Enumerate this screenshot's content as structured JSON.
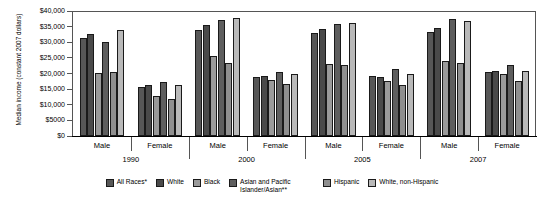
{
  "chart_data": {
    "type": "bar",
    "title": "",
    "xlabel": "",
    "ylabel": "Median income (constant 2007 dollars)",
    "ylim": [
      0,
      40000
    ],
    "ytick_labels": [
      "$40,000",
      "$35,000",
      "$30,000",
      "$25,000",
      "$20,000",
      "$15,000",
      "$10,000",
      "$5000",
      "$0"
    ],
    "ytick_values": [
      40000,
      35000,
      30000,
      25000,
      20000,
      15000,
      10000,
      5000,
      0
    ],
    "grid": false,
    "legend_position": "bottom",
    "categories": [
      "1990 Male",
      "1990 Female",
      "2000 Male",
      "2000 Female",
      "2005 Male",
      "2005 Female",
      "2007 Male",
      "2007 Female"
    ],
    "group_labels": [
      "Male",
      "Female",
      "Male",
      "Female",
      "Male",
      "Female",
      "Male",
      "Female"
    ],
    "year_labels": [
      "1990",
      "2000",
      "2005",
      "2007"
    ],
    "series": [
      {
        "name": "All Races*",
        "color": "#575757",
        "values": [
          31400,
          15700,
          33900,
          19000,
          33000,
          19100,
          33200,
          20500
        ]
      },
      {
        "name": "White",
        "color": "#4a4a4a",
        "values": [
          32600,
          16200,
          35400,
          19100,
          34200,
          19000,
          34700,
          20800
        ]
      },
      {
        "name": "Black",
        "color": "#9a9a9a",
        "values": [
          20300,
          12900,
          25600,
          18000,
          23000,
          17700,
          24000,
          19900
        ]
      },
      {
        "name": "Asian and Pacific Islander/Asian**",
        "color": "#5e5e5e",
        "values": [
          30100,
          17300,
          37000,
          20400,
          36000,
          21400,
          37300,
          22800
        ]
      },
      {
        "name": "Hispanic",
        "color": "#8f8f8f",
        "values": [
          20600,
          11800,
          23400,
          16600,
          22700,
          16200,
          23300,
          17700
        ]
      },
      {
        "name": "White, non-Hispanic",
        "color": "#b9b9b9",
        "values": [
          33800,
          16300,
          37700,
          19900,
          36200,
          20000,
          36700,
          20700
        ]
      }
    ]
  },
  "legend": {
    "items": [
      {
        "label": "All Races*"
      },
      {
        "label": "White"
      },
      {
        "label": "Black"
      },
      {
        "label": "Asian and Pacific Islander/Asian**"
      },
      {
        "label": "Hispanic"
      },
      {
        "label": "White, non-Hispanic"
      }
    ]
  }
}
